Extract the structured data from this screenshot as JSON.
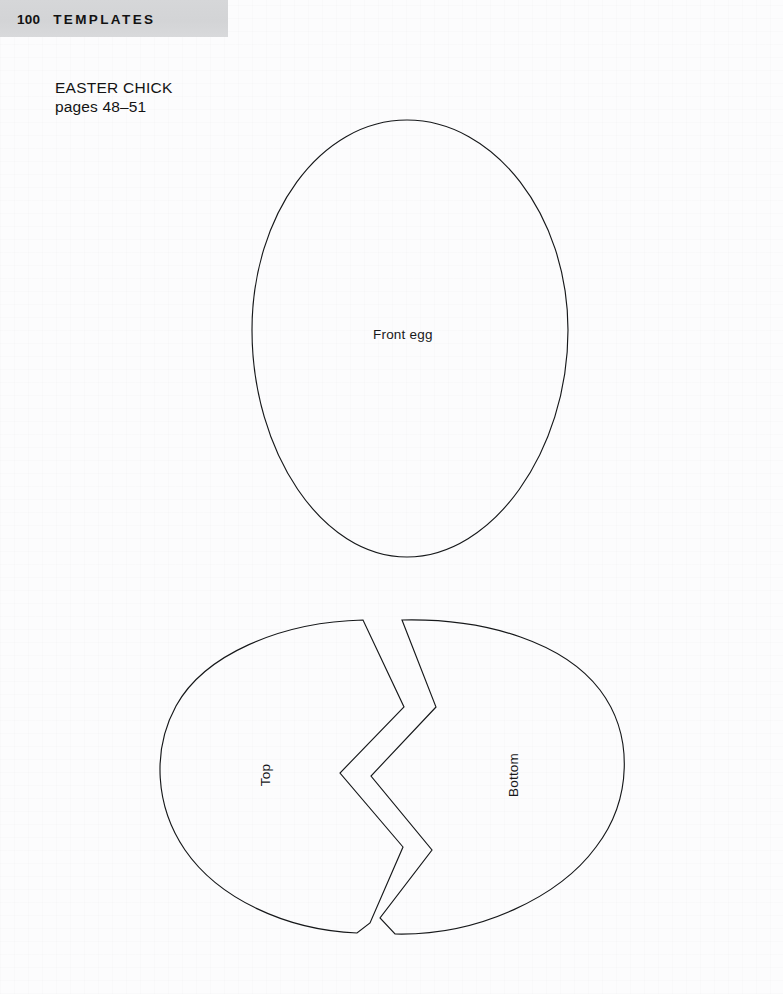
{
  "page": {
    "background_color": "#fcfcfd",
    "ink_color": "#16181a",
    "header_band_color": "#d5d6d8"
  },
  "header": {
    "folio": "100",
    "section": "TEMPLATES"
  },
  "caption": {
    "title": "EASTER CHICK",
    "pages": "pages 48–51"
  },
  "templates": [
    {
      "name": "front-egg",
      "label": "Front egg",
      "shape": "vertical-oval",
      "bbox": {
        "x": 252,
        "y": 120,
        "width": 316,
        "height": 437
      }
    },
    {
      "name": "cracked-egg-top",
      "label": "Top",
      "shape": "left-half-of-horizontal-oval-with-zigzag-crack",
      "bbox": {
        "x": 162,
        "y": 617,
        "width": 242,
        "height": 318
      }
    },
    {
      "name": "cracked-egg-bottom",
      "label": "Bottom",
      "shape": "right-half-of-horizontal-oval-with-zigzag-crack",
      "bbox": {
        "x": 340,
        "y": 617,
        "width": 287,
        "height": 318
      }
    }
  ]
}
